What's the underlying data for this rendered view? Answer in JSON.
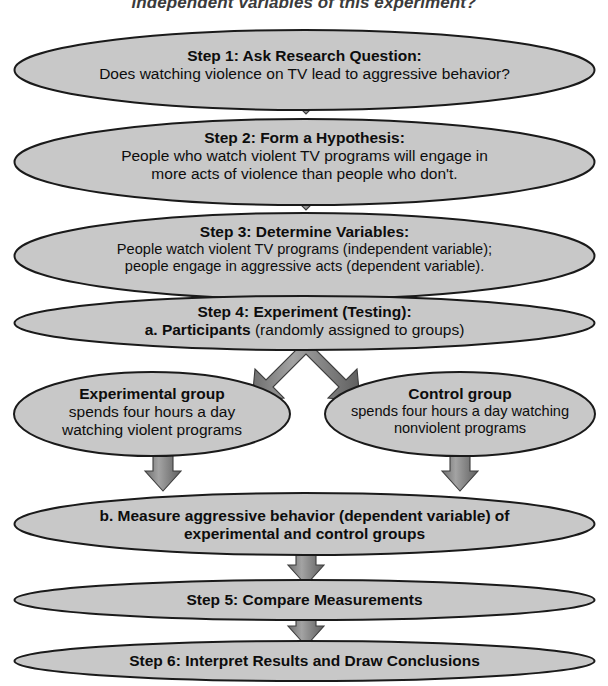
{
  "page": {
    "title_fragment": "independent variables of this experiment?",
    "background_color": "#ffffff",
    "node_fill_color": "#c8c8c8",
    "node_stroke_color": "#1a1a1a",
    "arrow_fill_color": "#878787",
    "arrow_stroke_color": "#3d3d3d",
    "text_color": "#0d0d0d"
  },
  "flowchart": {
    "type": "process-flow",
    "orientation": "top-to-bottom",
    "nodes": [
      {
        "id": "step1",
        "shape": "ellipse",
        "heading": "Step 1: Ask Research Question:",
        "lines": [
          "Does watching violence on TV lead to aggressive behavior?"
        ]
      },
      {
        "id": "step2",
        "shape": "ellipse",
        "heading": "Step 2: Form a Hypothesis:",
        "lines": [
          "People who watch violent TV programs will engage in",
          "more acts of violence than people who don't."
        ]
      },
      {
        "id": "step3",
        "shape": "ellipse",
        "heading": "Step 3: Determine Variables:",
        "lines": [
          "People watch violent TV programs (independent variable);",
          "people engage in aggressive acts (dependent variable)."
        ]
      },
      {
        "id": "step4",
        "shape": "ellipse",
        "heading": "Step 4: Experiment (Testing):",
        "sub_bold": "a. Participants",
        "sub_normal": " (randomly assigned to groups)"
      },
      {
        "id": "experimental-group",
        "shape": "ellipse",
        "heading": "Experimental group",
        "lines": [
          "spends four hours a day",
          "watching violent programs"
        ]
      },
      {
        "id": "control-group",
        "shape": "ellipse",
        "heading": "Control group",
        "lines": [
          "spends four hours a day watching",
          "nonviolent programs"
        ]
      },
      {
        "id": "measure",
        "shape": "ellipse",
        "lines_bold": [
          "b. Measure aggressive behavior (dependent variable) of",
          "experimental and control groups"
        ]
      },
      {
        "id": "step5",
        "shape": "ellipse",
        "heading": "Step 5: Compare Measurements"
      },
      {
        "id": "step6",
        "shape": "ellipse",
        "heading": "Step 6: Interpret Results and Draw Conclusions"
      }
    ],
    "connectors": [
      {
        "id": "arrow-step1-step2",
        "from": "step1",
        "to": "step2",
        "kind": "down-arrow"
      },
      {
        "id": "arrow-step2-step3",
        "from": "step2",
        "to": "step3",
        "kind": "down-arrow"
      },
      {
        "id": "arrow-step3-step4",
        "from": "step3",
        "to": "step4",
        "kind": "down-arrow"
      },
      {
        "id": "arrow-step4-split",
        "from": "step4",
        "to": "experimental-group, control-group",
        "kind": "split-arrow"
      },
      {
        "id": "arrow-experimental-measure",
        "from": "experimental-group",
        "to": "measure",
        "kind": "down-arrow"
      },
      {
        "id": "arrow-control-measure",
        "from": "control-group",
        "to": "measure",
        "kind": "down-arrow"
      },
      {
        "id": "arrow-measure-step5",
        "from": "measure",
        "to": "step5",
        "kind": "down-arrow"
      },
      {
        "id": "arrow-step5-step6",
        "from": "step5",
        "to": "step6",
        "kind": "down-arrow"
      }
    ]
  }
}
